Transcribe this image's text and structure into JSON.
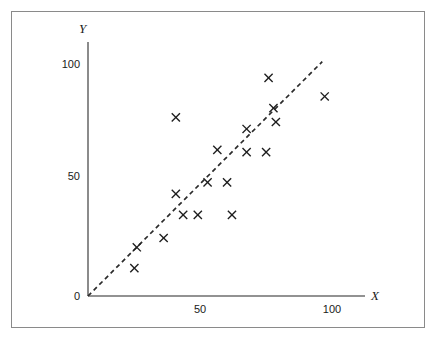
{
  "figure": {
    "frame_color": "#8a8a8a",
    "background": "#ffffff"
  },
  "axes": {
    "x_title": "X",
    "y_title": "Y",
    "origin_label": "0",
    "x_ticks": [
      "50",
      "100"
    ],
    "y_ticks": [
      "100",
      "50"
    ],
    "axis_color": "#6e6e6e"
  },
  "chart_data": {
    "type": "scatter",
    "title": "",
    "xlabel": "X",
    "ylabel": "Y",
    "xlim": [
      0,
      115
    ],
    "ylim": [
      0,
      108
    ],
    "xticks": [
      50,
      100
    ],
    "yticks": [
      0,
      50,
      100
    ],
    "grid": false,
    "legend": "none",
    "marker": "x",
    "marker_color": "#1d1d1d",
    "series": [
      {
        "name": "observations",
        "points": [
          [
            19,
            12
          ],
          [
            20,
            21
          ],
          [
            31,
            25
          ],
          [
            36,
            44
          ],
          [
            36,
            77
          ],
          [
            39,
            35
          ],
          [
            45,
            35
          ],
          [
            49,
            49
          ],
          [
            53,
            63
          ],
          [
            57,
            49
          ],
          [
            59,
            35
          ],
          [
            65,
            72
          ],
          [
            65,
            62
          ],
          [
            73,
            62
          ],
          [
            74,
            94
          ],
          [
            76,
            81
          ],
          [
            77,
            75
          ],
          [
            97,
            86
          ]
        ]
      }
    ],
    "reference_line": {
      "name": "identity-line",
      "style": "dashed",
      "color": "#2b2b2b",
      "from": [
        0,
        0
      ],
      "to": [
        96,
        101
      ]
    }
  }
}
